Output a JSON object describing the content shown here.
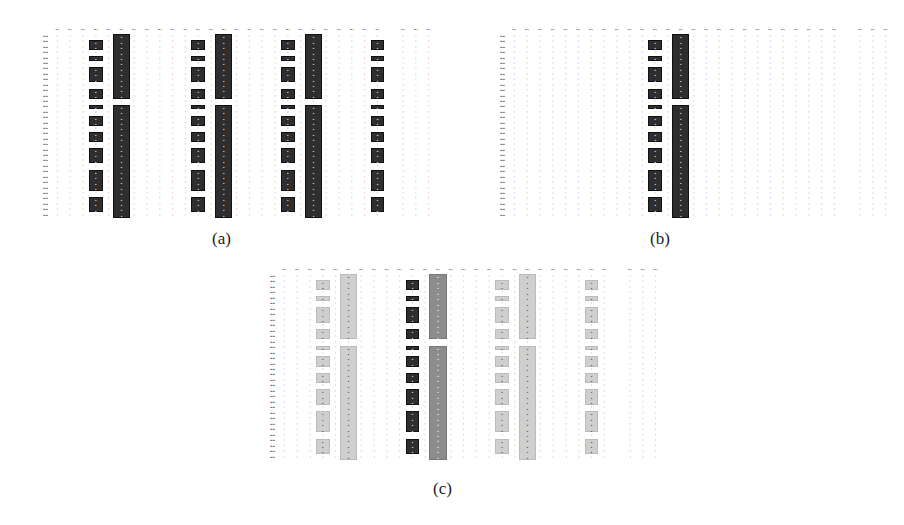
{
  "figure": {
    "panels": [
      {
        "id": "a",
        "label": "(a)",
        "x": 35,
        "y": 28,
        "width": 400,
        "height": 190,
        "label_x": 212,
        "label_y": 230,
        "n_cols": 30,
        "empty_cols": [
          26
        ],
        "n_rows": 34,
        "cell_value": "0",
        "blocks": [
          {
            "col": 3,
            "shade": "dark",
            "rows": [
              [
                1,
                2
              ],
              [
                4,
                4
              ],
              [
                6,
                8
              ],
              [
                10,
                11
              ],
              [
                13,
                13
              ],
              [
                15,
                16
              ],
              [
                18,
                19
              ],
              [
                21,
                23
              ],
              [
                25,
                28
              ],
              [
                30,
                32
              ]
            ]
          },
          {
            "col": 5,
            "shade": "dark",
            "wide": true,
            "rows": [
              [
                0,
                11
              ],
              [
                13,
                33
              ]
            ]
          },
          {
            "col": 11,
            "shade": "dark",
            "rows": [
              [
                1,
                2
              ],
              [
                4,
                4
              ],
              [
                6,
                8
              ],
              [
                10,
                11
              ],
              [
                13,
                13
              ],
              [
                15,
                16
              ],
              [
                18,
                19
              ],
              [
                21,
                23
              ],
              [
                25,
                28
              ],
              [
                30,
                32
              ]
            ]
          },
          {
            "col": 13,
            "shade": "dark",
            "wide": true,
            "rows": [
              [
                0,
                11
              ],
              [
                13,
                33
              ]
            ]
          },
          {
            "col": 18,
            "shade": "dark",
            "rows": [
              [
                1,
                2
              ],
              [
                4,
                4
              ],
              [
                6,
                8
              ],
              [
                10,
                11
              ],
              [
                13,
                13
              ],
              [
                15,
                16
              ],
              [
                18,
                19
              ],
              [
                21,
                23
              ],
              [
                25,
                28
              ],
              [
                30,
                32
              ]
            ]
          },
          {
            "col": 20,
            "shade": "dark",
            "wide": true,
            "rows": [
              [
                0,
                11
              ],
              [
                13,
                33
              ]
            ]
          },
          {
            "col": 25,
            "shade": "dark",
            "rows": [
              [
                1,
                2
              ],
              [
                4,
                4
              ],
              [
                6,
                8
              ],
              [
                10,
                11
              ],
              [
                13,
                13
              ],
              [
                15,
                16
              ],
              [
                18,
                19
              ],
              [
                21,
                23
              ],
              [
                25,
                28
              ],
              [
                30,
                32
              ]
            ]
          }
        ]
      },
      {
        "id": "b",
        "label": "(b)",
        "x": 492,
        "y": 28,
        "width": 400,
        "height": 190,
        "label_x": 650,
        "label_y": 230,
        "n_cols": 30,
        "empty_cols": [
          26
        ],
        "n_rows": 34,
        "cell_value": "0",
        "blocks": [
          {
            "col": 11,
            "shade": "dark",
            "rows": [
              [
                1,
                2
              ],
              [
                4,
                4
              ],
              [
                6,
                8
              ],
              [
                10,
                11
              ],
              [
                13,
                13
              ],
              [
                15,
                16
              ],
              [
                18,
                19
              ],
              [
                21,
                23
              ],
              [
                25,
                28
              ],
              [
                30,
                32
              ]
            ]
          },
          {
            "col": 13,
            "shade": "dark",
            "wide": true,
            "rows": [
              [
                0,
                11
              ],
              [
                13,
                33
              ]
            ]
          }
        ]
      },
      {
        "id": "c",
        "label": "(c)",
        "x": 262,
        "y": 268,
        "width": 400,
        "height": 192,
        "label_x": 433,
        "label_y": 480,
        "n_cols": 30,
        "empty_cols": [
          26
        ],
        "n_rows": 34,
        "cell_value": "0",
        "blocks": [
          {
            "col": 3,
            "shade": "light",
            "rows": [
              [
                1,
                2
              ],
              [
                4,
                4
              ],
              [
                6,
                8
              ],
              [
                10,
                11
              ],
              [
                13,
                13
              ],
              [
                15,
                16
              ],
              [
                18,
                19
              ],
              [
                21,
                23
              ],
              [
                25,
                28
              ],
              [
                30,
                32
              ]
            ]
          },
          {
            "col": 5,
            "shade": "light",
            "wide": true,
            "rows": [
              [
                0,
                11
              ],
              [
                13,
                33
              ]
            ]
          },
          {
            "col": 10,
            "shade": "dark",
            "rows": [
              [
                1,
                2
              ],
              [
                4,
                4
              ],
              [
                6,
                8
              ],
              [
                10,
                11
              ],
              [
                13,
                13
              ],
              [
                15,
                16
              ],
              [
                18,
                19
              ],
              [
                21,
                23
              ],
              [
                25,
                28
              ],
              [
                30,
                32
              ]
            ]
          },
          {
            "col": 12,
            "shade": "mid",
            "wide": true,
            "rows": [
              [
                0,
                11
              ],
              [
                13,
                33
              ]
            ]
          },
          {
            "col": 17,
            "shade": "light",
            "rows": [
              [
                1,
                2
              ],
              [
                4,
                4
              ],
              [
                6,
                8
              ],
              [
                10,
                11
              ],
              [
                13,
                13
              ],
              [
                15,
                16
              ],
              [
                18,
                19
              ],
              [
                21,
                23
              ],
              [
                25,
                28
              ],
              [
                30,
                32
              ]
            ]
          },
          {
            "col": 19,
            "shade": "light",
            "wide": true,
            "rows": [
              [
                0,
                11
              ],
              [
                13,
                33
              ]
            ]
          },
          {
            "col": 24,
            "shade": "light",
            "rows": [
              [
                1,
                2
              ],
              [
                4,
                4
              ],
              [
                6,
                8
              ],
              [
                10,
                11
              ],
              [
                13,
                13
              ],
              [
                15,
                16
              ],
              [
                18,
                19
              ],
              [
                21,
                23
              ],
              [
                25,
                28
              ],
              [
                30,
                32
              ]
            ]
          }
        ]
      }
    ],
    "colors": {
      "dark": "#2e2e2e",
      "mid": "#8c8c8c",
      "light": "#cfcfcf",
      "background": "#ffffff"
    }
  }
}
